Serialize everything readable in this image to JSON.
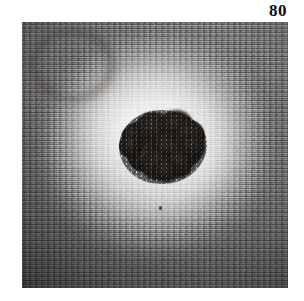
{
  "figure": {
    "number": "80",
    "caption_visible": false
  },
  "photo": {
    "type": "clinical-dermatology-photograph",
    "subject": "pigmented-skin-lesion",
    "rendering": "grayscale",
    "frame": {
      "left": 22,
      "top": 22,
      "width": 266,
      "height": 266
    },
    "background_color": "#ffffff"
  },
  "colors": {
    "page_background": "#ffffff",
    "figure_number": "#0d0d0d",
    "halo_highlight": "#f7f7f7",
    "skin_midtone": "#bdbdbd",
    "skin_periphery": "#6b6b6b",
    "lesion_core": "#2e2a27",
    "lesion_highlight": "#5d5751"
  },
  "lesion": {
    "center_x": 141,
    "center_y": 125,
    "width": 88,
    "height": 74,
    "lobes": [
      {
        "left": 2,
        "top": 12,
        "width": 34,
        "height": 33,
        "rotate": -12
      },
      {
        "left": 16,
        "top": 2,
        "width": 38,
        "height": 34,
        "rotate": 8
      },
      {
        "left": 40,
        "top": 0,
        "width": 34,
        "height": 30,
        "rotate": -6
      },
      {
        "left": 55,
        "top": 10,
        "width": 31,
        "height": 32,
        "rotate": 14
      },
      {
        "left": 50,
        "top": 26,
        "width": 34,
        "height": 31,
        "rotate": -9
      },
      {
        "left": 30,
        "top": 22,
        "width": 38,
        "height": 36,
        "rotate": 5
      },
      {
        "left": 8,
        "top": 30,
        "width": 34,
        "height": 32,
        "rotate": 18
      },
      {
        "left": 22,
        "top": 40,
        "width": 36,
        "height": 30,
        "rotate": -14
      },
      {
        "left": 44,
        "top": 40,
        "width": 30,
        "height": 28,
        "rotate": 10
      },
      {
        "left": 0,
        "top": 24,
        "width": 24,
        "height": 24,
        "rotate": 0
      },
      {
        "left": 62,
        "top": 24,
        "width": 24,
        "height": 25,
        "rotate": 0
      },
      {
        "left": 34,
        "top": 48,
        "width": 26,
        "height": 24,
        "rotate": 6
      }
    ]
  },
  "artifacts": {
    "specks": [
      {
        "left": 168,
        "top": 52,
        "width": 3,
        "height": 2
      },
      {
        "left": 74,
        "top": 214,
        "width": 2,
        "height": 2
      },
      {
        "left": 212,
        "top": 232,
        "width": 2,
        "height": 3
      },
      {
        "left": 96,
        "top": 40,
        "width": 2,
        "height": 2
      },
      {
        "left": 236,
        "top": 150,
        "width": 2,
        "height": 2
      }
    ]
  }
}
